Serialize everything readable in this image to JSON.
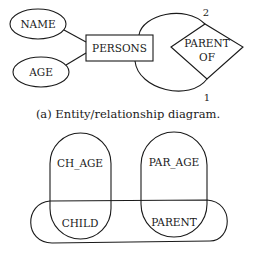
{
  "er_diagram": {
    "attributes": [
      {
        "label": "NAME"
      },
      {
        "label": "AGE"
      }
    ],
    "entity": {
      "label": "PERSONS"
    },
    "relationship": {
      "line1": "PARENT",
      "line2": "OF"
    },
    "cardinalities": {
      "top": "2",
      "bottom": "1"
    },
    "caption": "(a) Entity/relationship diagram."
  },
  "hypergraph": {
    "nodes": [
      {
        "label": "CH_AGE"
      },
      {
        "label": "PAR_AGE"
      },
      {
        "label": "CHILD"
      },
      {
        "label": "PARENT"
      }
    ]
  },
  "colors": {
    "stroke": "#1a1a1a",
    "background": "#ffffff"
  }
}
